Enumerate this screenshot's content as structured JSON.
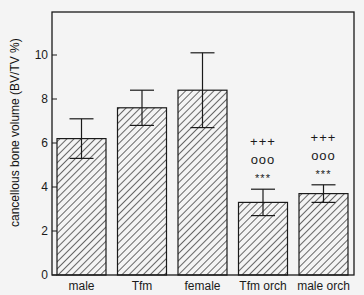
{
  "chart_data": {
    "type": "bar",
    "title": "",
    "xlabel": "",
    "ylabel": "cancellous bone volume (BV/TV %)",
    "ylim": [
      0,
      12
    ],
    "yticks": [
      0,
      2,
      4,
      6,
      8,
      10
    ],
    "grid": false,
    "legend": null,
    "categories": [
      "male",
      "Tfm",
      "female",
      "Tfm orch",
      "male orch"
    ],
    "values": [
      6.2,
      7.6,
      8.4,
      3.3,
      3.7
    ],
    "error_upper": [
      7.1,
      8.4,
      10.1,
      3.9,
      4.1
    ],
    "error_lower": [
      5.3,
      6.8,
      6.7,
      2.7,
      3.3
    ],
    "annotations": [
      {
        "category": "Tfm orch",
        "lines": [
          "+++",
          "ooo",
          "***"
        ]
      },
      {
        "category": "male orch",
        "lines": [
          "+++",
          "ooo",
          "***"
        ]
      }
    ],
    "bar_fill": "diagonal hatch"
  },
  "colors": {
    "background": "#f4f4f4",
    "ink": "#1a1a1a"
  }
}
